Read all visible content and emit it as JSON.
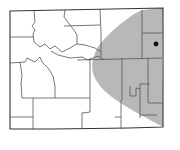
{
  "map": {
    "region": "Wyoming",
    "subdivisions": "counties",
    "range_fill_color": "#b8b8b8",
    "border_color": "#555555",
    "background_color": "#ffffff",
    "marker": {
      "type": "locality-dot",
      "color": "#111111"
    },
    "legend": []
  },
  "caption": ""
}
